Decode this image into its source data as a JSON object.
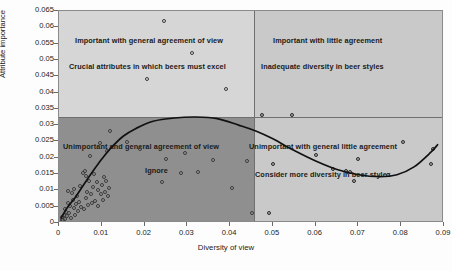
{
  "chart_data": {
    "type": "scatter",
    "title": "",
    "xlabel": "Diversity of view",
    "ylabel": "Attribute importance",
    "xlim": [
      0,
      0.09
    ],
    "ylim": [
      0,
      0.065
    ],
    "grid": false,
    "legend": "none",
    "xticks": [
      "0",
      "0.01",
      "0.02",
      "0.03",
      "0.04",
      "0.05",
      "0.06",
      "0.07",
      "0.08",
      "0.09"
    ],
    "yticks": [
      "0",
      "0.005",
      "0.01",
      "0.015",
      "0.02",
      "0.025",
      "0.03",
      "0.035",
      "0.04",
      "0.045",
      "0.05",
      "0.055",
      "0.06",
      "0.065"
    ],
    "xtick_values": [
      0,
      0.01,
      0.02,
      0.03,
      0.04,
      0.05,
      0.06,
      0.07,
      0.08,
      0.09
    ],
    "ytick_values": [
      0,
      0.005,
      0.01,
      0.015,
      0.02,
      0.025,
      0.03,
      0.035,
      0.04,
      0.045,
      0.05,
      0.055,
      0.06,
      0.065
    ],
    "quadrant_divider_x": 0.0455,
    "quadrant_divider_y": 0.0325,
    "annotations": [
      {
        "quadrant": "upper-left",
        "line1": "Important with general agreement of view",
        "line2": "Crucial attributes in which beers must excel"
      },
      {
        "quadrant": "upper-right",
        "line1": "Important with little agreement",
        "line2": "Inadequate diversity in beer styles"
      },
      {
        "quadrant": "lower-left",
        "line1": "Unimportant and general agreement of view",
        "line2": "Ignore"
      },
      {
        "quadrant": "lower-right",
        "line1": "Unimportant with general little agreement",
        "line2": "Consider more diversity in beer styles"
      }
    ],
    "series": [
      {
        "name": "attributes",
        "marker": "open-circle",
        "points": [
          [
            0.0006,
            0.001
          ],
          [
            0.0008,
            0.0018
          ],
          [
            0.001,
            0.0008
          ],
          [
            0.0012,
            0.0026
          ],
          [
            0.0013,
            0.0042
          ],
          [
            0.0015,
            0.0013
          ],
          [
            0.0016,
            0.0035
          ],
          [
            0.0018,
            0.0021
          ],
          [
            0.002,
            0.0098
          ],
          [
            0.0022,
            0.0062
          ],
          [
            0.0024,
            0.003
          ],
          [
            0.0026,
            0.0052
          ],
          [
            0.0028,
            0.0016
          ],
          [
            0.003,
            0.0092
          ],
          [
            0.0032,
            0.007
          ],
          [
            0.0034,
            0.0046
          ],
          [
            0.0036,
            0.0105
          ],
          [
            0.0038,
            0.0024
          ],
          [
            0.004,
            0.0058
          ],
          [
            0.0042,
            0.0084
          ],
          [
            0.0044,
            0.0038
          ],
          [
            0.0046,
            0.0064
          ],
          [
            0.005,
            0.0112
          ],
          [
            0.0052,
            0.0048
          ],
          [
            0.0055,
            0.0152
          ],
          [
            0.0058,
            0.0042
          ],
          [
            0.006,
            0.016
          ],
          [
            0.0062,
            0.0076
          ],
          [
            0.0064,
            0.0144
          ],
          [
            0.0066,
            0.0094
          ],
          [
            0.0068,
            0.0056
          ],
          [
            0.007,
            0.013
          ],
          [
            0.0072,
            0.0204
          ],
          [
            0.0075,
            0.0088
          ],
          [
            0.0078,
            0.0062
          ],
          [
            0.008,
            0.011
          ],
          [
            0.0082,
            0.015
          ],
          [
            0.0085,
            0.0068
          ],
          [
            0.0088,
            0.0126
          ],
          [
            0.009,
            0.01
          ],
          [
            0.0092,
            0.0052
          ],
          [
            0.0095,
            0.0244
          ],
          [
            0.0098,
            0.0088
          ],
          [
            0.01,
            0.0116
          ],
          [
            0.0102,
            0.0072
          ],
          [
            0.0105,
            0.014
          ],
          [
            0.0108,
            0.0096
          ],
          [
            0.011,
            0.0128
          ],
          [
            0.0112,
            0.0222
          ],
          [
            0.0115,
            0.0082
          ],
          [
            0.0118,
            0.0108
          ],
          [
            0.012,
            0.0282
          ],
          [
            0.016,
            0.0248
          ],
          [
            0.019,
            0.0228
          ],
          [
            0.0205,
            0.044
          ],
          [
            0.024,
            0.0126
          ],
          [
            0.0245,
            0.062
          ],
          [
            0.025,
            0.0196
          ],
          [
            0.0285,
            0.0152
          ],
          [
            0.0295,
            0.0214
          ],
          [
            0.031,
            0.052
          ],
          [
            0.0325,
            0.0156
          ],
          [
            0.036,
            0.0192
          ],
          [
            0.039,
            0.041
          ],
          [
            0.0405,
            0.0108
          ],
          [
            0.044,
            0.019
          ],
          [
            0.045,
            0.0032
          ],
          [
            0.0475,
            0.033
          ],
          [
            0.049,
            0.0032
          ],
          [
            0.05,
            0.0182
          ],
          [
            0.0545,
            0.033
          ],
          [
            0.06,
            0.0208
          ],
          [
            0.064,
            0.0166
          ],
          [
            0.067,
            0.016
          ],
          [
            0.068,
            0.0155
          ],
          [
            0.069,
            0.013
          ],
          [
            0.07,
            0.0196
          ],
          [
            0.077,
            0.0146
          ],
          [
            0.0805,
            0.0248
          ],
          [
            0.087,
            0.0182
          ],
          [
            0.0875,
            0.0228
          ]
        ]
      }
    ],
    "trend_line": {
      "type": "polynomial-fit",
      "description": "cubic trend rising steeply from origin, peaking near x=0.037 at y=0.032, descending to minimum near x=0.076 at y=0.014, rising again to x=0.088",
      "points": [
        [
          0.0005,
          0.0015
        ],
        [
          0.002,
          0.0048
        ],
        [
          0.004,
          0.0082
        ],
        [
          0.006,
          0.0122
        ],
        [
          0.008,
          0.016
        ],
        [
          0.01,
          0.0196
        ],
        [
          0.012,
          0.0228
        ],
        [
          0.015,
          0.0266
        ],
        [
          0.018,
          0.029
        ],
        [
          0.022,
          0.0312
        ],
        [
          0.027,
          0.0322
        ],
        [
          0.032,
          0.0325
        ],
        [
          0.037,
          0.032
        ],
        [
          0.042,
          0.03
        ],
        [
          0.046,
          0.0282
        ],
        [
          0.05,
          0.0258
        ],
        [
          0.055,
          0.0222
        ],
        [
          0.06,
          0.019
        ],
        [
          0.065,
          0.0164
        ],
        [
          0.07,
          0.0148
        ],
        [
          0.075,
          0.0142
        ],
        [
          0.079,
          0.0148
        ],
        [
          0.083,
          0.0172
        ],
        [
          0.087,
          0.0218
        ],
        [
          0.0885,
          0.024
        ]
      ]
    }
  }
}
